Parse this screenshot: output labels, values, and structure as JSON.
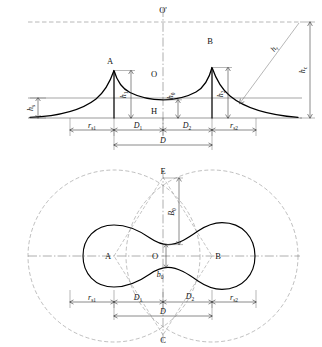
{
  "figure": {
    "views": [
      {
        "id": "elevation",
        "name": "elevation-view"
      },
      {
        "id": "plan",
        "name": "plan-view"
      }
    ]
  },
  "elevation": {
    "points": {
      "apex_left": "A",
      "apex_right": "B",
      "saddle": "O",
      "axis_top": "O'",
      "base_center": "H"
    },
    "vertical_dims": {
      "h_s": {
        "base": "h",
        "sub": "s"
      },
      "h1": {
        "base": "h",
        "sub": "1"
      },
      "h0": {
        "base": "h",
        "sub": "0"
      },
      "h2": {
        "base": "h",
        "sub": "2"
      },
      "hc": {
        "base": "h",
        "sub": "c"
      },
      "hr": {
        "base": "h",
        "sub": "r"
      }
    },
    "horizontal_dims": {
      "rs1": {
        "base": "r",
        "sub": "s1"
      },
      "D1": {
        "base": "D",
        "sub": "1"
      },
      "D2": {
        "base": "D",
        "sub": "2"
      },
      "rs2": {
        "base": "r",
        "sub": "s2"
      },
      "D": {
        "base": "D",
        "sub": ""
      }
    }
  },
  "plan": {
    "points": {
      "left_center": "A",
      "right_center": "B",
      "origin": "O",
      "top": "E",
      "bottom": "C"
    },
    "vertical_dims": {
      "B0": {
        "base": "B",
        "sub": "0"
      },
      "b0": {
        "base": "b",
        "sub": "0"
      }
    },
    "horizontal_dims": {
      "rs1": {
        "base": "r",
        "sub": "s1"
      },
      "D1": {
        "base": "D",
        "sub": "1"
      },
      "D2": {
        "base": "D",
        "sub": "2"
      },
      "rs2": {
        "base": "r",
        "sub": "s2"
      },
      "D": {
        "base": "D",
        "sub": ""
      }
    }
  },
  "colors": {
    "ink": "#111111",
    "construction": "#8a8a8a",
    "dimension": "#2a2a2a",
    "background": "#ffffff"
  }
}
